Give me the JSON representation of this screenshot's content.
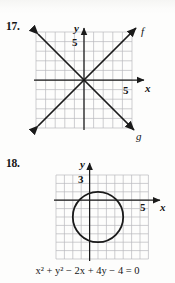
{
  "page": {
    "background_color": "#fdfdfc",
    "ink_color": "#141414",
    "grid_color": "#b9b9bd",
    "axis_color": "#1a1a1a"
  },
  "problems": [
    {
      "number": "17.",
      "figure": {
        "type": "line-graph",
        "axis_labels": {
          "x": "x",
          "y": "y"
        },
        "tick_labels": {
          "x": "5",
          "y": "5"
        },
        "grid": {
          "columns": 10,
          "rows": 10,
          "origin_col": 5,
          "origin_row": 5
        },
        "curves": [
          {
            "label": "f",
            "slope": 1,
            "intercept": 0,
            "arrows": "both"
          },
          {
            "label": "g",
            "slope": -1,
            "intercept": 0,
            "arrows": "both"
          }
        ]
      }
    },
    {
      "number": "18.",
      "figure": {
        "type": "circle-graph",
        "axis_labels": {
          "x": "x",
          "y": "y"
        },
        "tick_labels": {
          "x": "5",
          "y": "3"
        },
        "grid": {
          "columns": 10,
          "rows": 10,
          "origin_col": 4,
          "origin_row": 3
        },
        "circle": {
          "center_x": 1,
          "center_y": -2,
          "radius": 3
        }
      },
      "equation": {
        "full_text": "x² + y² − 2x + 4y − 4 = 0",
        "terms": [
          {
            "var": "x",
            "power": "2"
          },
          {
            "op": "+"
          },
          {
            "var": "y",
            "power": "2"
          },
          {
            "op": "−"
          },
          {
            "coef": "2",
            "var": "x"
          },
          {
            "op": "+"
          },
          {
            "coef": "4",
            "var": "y"
          },
          {
            "op": "−"
          },
          {
            "coef": "4"
          },
          {
            "op": "="
          },
          {
            "coef": "0"
          }
        ]
      }
    }
  ]
}
